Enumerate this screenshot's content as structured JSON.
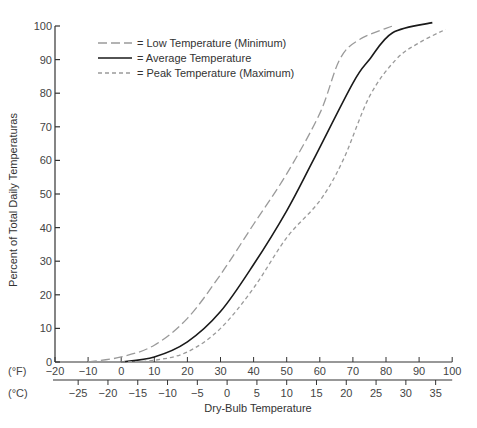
{
  "chart_data": {
    "type": "line",
    "title": "",
    "xlabel": "Dry-Bulb Temperature",
    "ylabel": "Percent of Total Daily Temperaturas",
    "x_axes": {
      "fahrenheit": {
        "unit_label": "(°F)",
        "ticks": [
          -20,
          -10,
          0,
          10,
          20,
          30,
          40,
          50,
          60,
          70,
          80,
          90,
          100
        ],
        "range": [
          -20,
          100
        ]
      },
      "celsius": {
        "unit_label": "(°C)",
        "ticks": [
          -25,
          -20,
          -15,
          -10,
          -5,
          0,
          5,
          10,
          15,
          20,
          25,
          30,
          35
        ]
      }
    },
    "y_ticks": [
      0,
      10,
      20,
      30,
      40,
      50,
      60,
      70,
      80,
      90,
      100
    ],
    "ylim": [
      0,
      100
    ],
    "grid": false,
    "legend_position": "upper-left",
    "series": [
      {
        "name": "= Low Temperature (Minimum)",
        "style": "long-dash",
        "color": "#9a9a9a",
        "x": [
          -10,
          0,
          10,
          20,
          30,
          40,
          50,
          60,
          66,
          72,
          82
        ],
        "values": [
          0,
          1.5,
          5,
          13,
          26,
          41,
          56,
          74,
          90,
          96,
          100
        ]
      },
      {
        "name": "= Average Temperature",
        "style": "solid",
        "color": "#1a1a1a",
        "x": [
          0,
          10,
          20,
          30,
          40,
          50,
          58,
          70,
          75,
          82,
          94
        ],
        "values": [
          0,
          1.5,
          6,
          15,
          29,
          45,
          60,
          83,
          90,
          98,
          101
        ]
      },
      {
        "name": "= Peak Temperature (Maximum)",
        "style": "short-dash",
        "color": "#9a9a9a",
        "x": [
          0,
          10,
          20,
          30,
          40,
          50,
          60,
          67,
          75,
          83,
          90,
          98
        ],
        "values": [
          0,
          0.5,
          3,
          10,
          22,
          37,
          48,
          60,
          79,
          90,
          95,
          99
        ]
      }
    ]
  }
}
